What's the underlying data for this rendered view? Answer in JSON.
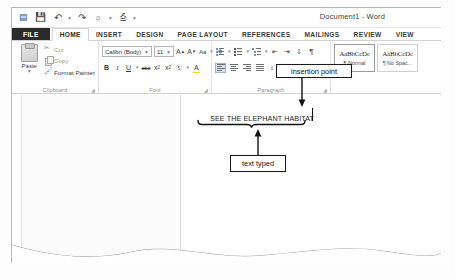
{
  "window": {
    "title": "Document1 - Word"
  },
  "quick_access": {
    "items": [
      {
        "name": "word-app-icon",
        "glyph": "▤"
      },
      {
        "name": "save-icon",
        "glyph": "💾"
      },
      {
        "name": "undo-icon",
        "glyph": "↶"
      },
      {
        "name": "redo-icon",
        "glyph": "↷"
      },
      {
        "name": "touch-mode-icon",
        "glyph": "☰"
      },
      {
        "name": "customize-qat-icon",
        "glyph": "⬇"
      }
    ]
  },
  "tabs": [
    {
      "label": "FILE",
      "kind": "file"
    },
    {
      "label": "HOME",
      "kind": "active"
    },
    {
      "label": "INSERT",
      "kind": "normal"
    },
    {
      "label": "DESIGN",
      "kind": "normal"
    },
    {
      "label": "PAGE LAYOUT",
      "kind": "normal"
    },
    {
      "label": "REFERENCES",
      "kind": "normal"
    },
    {
      "label": "MAILINGS",
      "kind": "normal"
    },
    {
      "label": "REVIEW",
      "kind": "normal"
    },
    {
      "label": "VIEW",
      "kind": "normal"
    }
  ],
  "ribbon": {
    "clipboard": {
      "group_label": "Clipboard",
      "paste_label": "Paste",
      "items": [
        {
          "label": "Cut",
          "icon": "scissors-icon"
        },
        {
          "label": "Copy",
          "icon": "copy-icon"
        },
        {
          "label": "Format Painter",
          "icon": "format-painter-icon"
        }
      ]
    },
    "font": {
      "group_label": "Font",
      "font_name": "Calibri (Body)",
      "font_size": "11",
      "grow_label": "A",
      "shrink_label": "A",
      "bold_label": "B",
      "italic_label": "I",
      "underline_label": "U",
      "strike_label": "abc",
      "subscript_label": "x",
      "superscript_label": "x",
      "text_effects_label": "A",
      "highlight_label": "A",
      "font_color_label": "A"
    },
    "paragraph": {
      "group_label": "Paragraph",
      "change_case_label": "Aa",
      "clear_formatting_label": "✐"
    },
    "styles": {
      "group_label": "Styles",
      "items": [
        {
          "sample": "AaBbCcDc",
          "name": "¶ Normal",
          "active": true
        },
        {
          "sample": "AaBbCcDc",
          "name": "¶ No Spac...",
          "active": false
        }
      ]
    }
  },
  "document": {
    "text": "SEE THE ELEPHANT HABITAT"
  },
  "annotations": [
    {
      "id": "insertion",
      "label": "insertion point"
    },
    {
      "id": "texttyped",
      "label": "text typed"
    }
  ],
  "colors": {
    "file_tab": "#2b2b2b",
    "annotation_border": "#1a1a1a",
    "page_background": "#ffffff"
  }
}
